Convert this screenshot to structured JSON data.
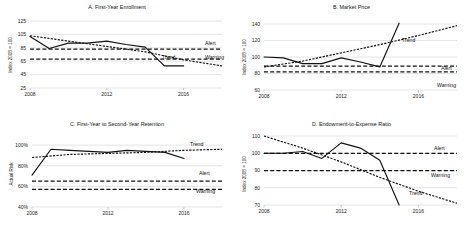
{
  "figure": {
    "panel_count": 4,
    "background": "#ffffff",
    "line_color": "#111111",
    "grid_color": "#c9c9c9"
  },
  "panels": {
    "a": {
      "title": "A. First-Year Enrollment",
      "ylabel": "Index 2008 = 100",
      "yticks": [
        "125",
        "105",
        "85",
        "65",
        "45",
        "25"
      ],
      "xticks": [
        "2008",
        "2012",
        "2016"
      ],
      "labels": {
        "trend": "Trend",
        "alert": "Alert",
        "warning": "Warning"
      }
    },
    "b": {
      "title": "B. Market Price",
      "ylabel": "Index 2008 = 100",
      "yticks": [
        "140",
        "120",
        "100",
        "80",
        "60"
      ],
      "xticks": [
        "2008",
        "2012",
        "2016"
      ],
      "labels": {
        "trend": "Trend",
        "alert": "Alert",
        "warning": "Warning"
      }
    },
    "c": {
      "title": "C. First-Year to Second-Year Retention",
      "ylabel": "Actual Risk",
      "yticks": [
        "100%",
        "80%",
        "60%",
        "40%"
      ],
      "xticks": [
        "2008",
        "2012",
        "2016"
      ],
      "labels": {
        "trend": "Trend",
        "alert": "Alert",
        "warning": "Warning"
      }
    },
    "d": {
      "title": "D. Endowment-to-Expense Ratio",
      "ylabel": "Index 2008 = 100",
      "yticks": [
        "110",
        "100",
        "90",
        "80",
        "70"
      ],
      "xticks": [
        "2008",
        "2012",
        "2016"
      ],
      "labels": {
        "trend": "Trend",
        "alert": "Alert",
        "warning": "Warning"
      }
    }
  },
  "chart_data": [
    {
      "id": "a",
      "type": "line",
      "title": "A. First-Year Enrollment",
      "xlabel": "",
      "ylabel": "Index 2008 = 100",
      "ylim": [
        25,
        125
      ],
      "xlim": [
        2008,
        2018
      ],
      "yticks": [
        125,
        105,
        85,
        65,
        45,
        25
      ],
      "xticks": [
        2008,
        2012,
        2016
      ],
      "grid": true,
      "legend": "inline-labels",
      "series": [
        {
          "name": "Actual",
          "style": "solid",
          "x": [
            2008,
            2009,
            2010,
            2011,
            2012,
            2013,
            2014,
            2015,
            2016
          ],
          "values": [
            102,
            84,
            92,
            92,
            95,
            90,
            86,
            58,
            58
          ]
        },
        {
          "name": "Trend",
          "style": "dotted",
          "x": [
            2008,
            2010,
            2012,
            2014,
            2016,
            2018
          ],
          "values": [
            103,
            95,
            87,
            79,
            67,
            58
          ]
        },
        {
          "name": "Alert",
          "style": "dashed",
          "x": [
            2008,
            2018
          ],
          "values": [
            83,
            83
          ]
        },
        {
          "name": "Warning",
          "style": "dashed",
          "x": [
            2008,
            2018
          ],
          "values": [
            68,
            68
          ]
        }
      ]
    },
    {
      "id": "b",
      "type": "line",
      "title": "B. Market Price",
      "xlabel": "",
      "ylabel": "Index 2008 = 100",
      "ylim": [
        60,
        140
      ],
      "xlim": [
        2008,
        2018
      ],
      "yticks": [
        140,
        120,
        100,
        80,
        60
      ],
      "xticks": [
        2008,
        2012,
        2016
      ],
      "grid": true,
      "legend": "inline-labels",
      "series": [
        {
          "name": "Actual",
          "style": "solid",
          "x": [
            2008,
            2009,
            2010,
            2011,
            2012,
            2013,
            2014,
            2015
          ],
          "values": [
            100,
            99,
            92,
            92,
            99,
            94,
            88,
            141
          ]
        },
        {
          "name": "Trend",
          "style": "dotted",
          "x": [
            2008,
            2010,
            2012,
            2014,
            2016,
            2018
          ],
          "values": [
            88,
            95,
            105,
            115,
            126,
            138
          ]
        },
        {
          "name": "Alert",
          "style": "dashed",
          "x": [
            2008,
            2018
          ],
          "values": [
            89,
            89
          ]
        },
        {
          "name": "Warning",
          "style": "dashed",
          "x": [
            2008,
            2018
          ],
          "values": [
            82,
            82
          ]
        }
      ]
    },
    {
      "id": "c",
      "type": "line",
      "title": "C. First-Year to Second-Year Retention",
      "xlabel": "",
      "ylabel": "Actual Risk",
      "ylim": [
        40,
        105
      ],
      "xlim": [
        2008,
        2018
      ],
      "yticks": [
        100,
        80,
        60,
        40
      ],
      "ytick_labels": [
        "100%",
        "80%",
        "60%",
        "40%"
      ],
      "xticks": [
        2008,
        2012,
        2016
      ],
      "grid": true,
      "legend": "inline-labels",
      "series": [
        {
          "name": "Actual",
          "style": "solid",
          "x": [
            2008,
            2009,
            2010,
            2011,
            2012,
            2013,
            2014,
            2015,
            2016
          ],
          "values": [
            71,
            96,
            95,
            94,
            93,
            95,
            94,
            93,
            87
          ]
        },
        {
          "name": "Trend",
          "style": "dotted",
          "x": [
            2008,
            2010,
            2012,
            2014,
            2016,
            2018
          ],
          "values": [
            88,
            91,
            92,
            93,
            95,
            96
          ]
        },
        {
          "name": "Alert",
          "style": "dashed",
          "x": [
            2008,
            2018
          ],
          "values": [
            65,
            65
          ]
        },
        {
          "name": "Warning",
          "style": "dashed",
          "x": [
            2008,
            2018
          ],
          "values": [
            57,
            57
          ]
        }
      ]
    },
    {
      "id": "d",
      "type": "line",
      "title": "D. Endowment-to-Expense Ratio",
      "xlabel": "",
      "ylabel": "Index 2008 = 100",
      "ylim": [
        70,
        110
      ],
      "xlim": [
        2008,
        2018
      ],
      "yticks": [
        110,
        100,
        90,
        80,
        70
      ],
      "xticks": [
        2008,
        2012,
        2016
      ],
      "grid": true,
      "legend": "inline-labels",
      "series": [
        {
          "name": "Actual",
          "style": "solid",
          "x": [
            2008,
            2009,
            2010,
            2011,
            2012,
            2013,
            2014,
            2015
          ],
          "values": [
            100,
            100,
            101,
            97,
            106,
            103,
            96,
            70
          ]
        },
        {
          "name": "Trend",
          "style": "dotted",
          "x": [
            2008,
            2010,
            2012,
            2014,
            2016,
            2018
          ],
          "values": [
            110,
            103,
            95,
            86,
            78,
            71
          ]
        },
        {
          "name": "Alert",
          "style": "dashed",
          "x": [
            2008,
            2018
          ],
          "values": [
            100,
            100
          ]
        },
        {
          "name": "Warning",
          "style": "dashed",
          "x": [
            2008,
            2018
          ],
          "values": [
            90,
            90
          ]
        }
      ]
    }
  ]
}
